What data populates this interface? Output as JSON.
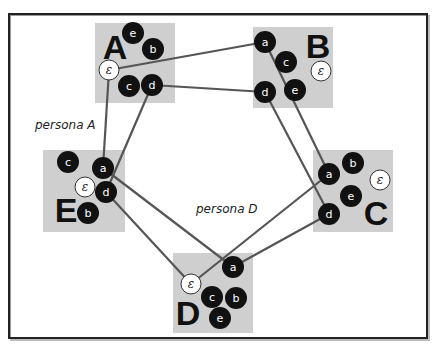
{
  "colors": {
    "background": "#ffffff",
    "frame": "#222222",
    "box_fill": "#cfcfcf",
    "node_fill": "#111111",
    "epsilon_fill": "#ffffff",
    "link": "#555555"
  },
  "labels": {
    "persona_a": "persona A",
    "persona_d": "persona D"
  },
  "groups": [
    {
      "id": "A",
      "label": "A",
      "box": [
        95,
        23,
        80,
        80
      ],
      "label_pos": [
        115,
        47
      ],
      "nodes": [
        {
          "id": "e",
          "label": "e",
          "pos": [
            133,
            33
          ],
          "type": "dark"
        },
        {
          "id": "b",
          "label": "b",
          "pos": [
            153,
            49
          ],
          "type": "dark"
        },
        {
          "id": "eps",
          "label": "ε",
          "pos": [
            109,
            70
          ],
          "type": "light"
        },
        {
          "id": "c",
          "label": "c",
          "pos": [
            129,
            86
          ],
          "type": "dark"
        },
        {
          "id": "d",
          "label": "d",
          "pos": [
            152,
            85
          ],
          "type": "dark"
        }
      ]
    },
    {
      "id": "B",
      "label": "B",
      "box": [
        253,
        27,
        80,
        81
      ],
      "label_pos": [
        318,
        46
      ],
      "nodes": [
        {
          "id": "a",
          "label": "a",
          "pos": [
            265,
            42
          ],
          "type": "dark"
        },
        {
          "id": "c",
          "label": "c",
          "pos": [
            286,
            62
          ],
          "type": "dark"
        },
        {
          "id": "eps",
          "label": "ε",
          "pos": [
            321,
            71
          ],
          "type": "light"
        },
        {
          "id": "d",
          "label": "d",
          "pos": [
            265,
            92
          ],
          "type": "dark"
        },
        {
          "id": "e",
          "label": "e",
          "pos": [
            295,
            90
          ],
          "type": "dark"
        }
      ]
    },
    {
      "id": "C",
      "label": "C",
      "box": [
        313,
        150,
        80,
        82
      ],
      "label_pos": [
        376,
        213
      ],
      "nodes": [
        {
          "id": "b",
          "label": "b",
          "pos": [
            353,
            163
          ],
          "type": "dark"
        },
        {
          "id": "a",
          "label": "a",
          "pos": [
            329,
            174
          ],
          "type": "dark"
        },
        {
          "id": "eps",
          "label": "ε",
          "pos": [
            380,
            180
          ],
          "type": "light"
        },
        {
          "id": "e",
          "label": "e",
          "pos": [
            351,
            196
          ],
          "type": "dark"
        },
        {
          "id": "d",
          "label": "d",
          "pos": [
            329,
            214
          ],
          "type": "dark"
        }
      ]
    },
    {
      "id": "D",
      "label": "D",
      "box": [
        173,
        253,
        80,
        80
      ],
      "label_pos": [
        188,
        313
      ],
      "nodes": [
        {
          "id": "a",
          "label": "a",
          "pos": [
            233,
            267
          ],
          "type": "dark"
        },
        {
          "id": "eps",
          "label": "ε",
          "pos": [
            191,
            284
          ],
          "type": "light"
        },
        {
          "id": "c",
          "label": "c",
          "pos": [
            212,
            297
          ],
          "type": "dark"
        },
        {
          "id": "b",
          "label": "b",
          "pos": [
            236,
            298
          ],
          "type": "dark"
        },
        {
          "id": "e",
          "label": "e",
          "pos": [
            220,
            318
          ],
          "type": "dark"
        }
      ]
    },
    {
      "id": "E",
      "label": "E",
      "box": [
        43,
        150,
        82,
        82
      ],
      "label_pos": [
        66,
        210
      ],
      "nodes": [
        {
          "id": "c",
          "label": "c",
          "pos": [
            68,
            162
          ],
          "type": "dark"
        },
        {
          "id": "a",
          "label": "a",
          "pos": [
            103,
            168
          ],
          "type": "dark"
        },
        {
          "id": "eps",
          "label": "ε",
          "pos": [
            85,
            187
          ],
          "type": "light"
        },
        {
          "id": "d",
          "label": "d",
          "pos": [
            106,
            192
          ],
          "type": "dark"
        },
        {
          "id": "b",
          "label": "b",
          "pos": [
            88,
            213
          ],
          "type": "dark"
        }
      ]
    }
  ],
  "links": [
    {
      "from": "A.eps",
      "to": "B.a"
    },
    {
      "from": "A.d",
      "to": "B.d"
    },
    {
      "from": "A.eps",
      "to": "E.a"
    },
    {
      "from": "A.d",
      "to": "E.d"
    },
    {
      "from": "B.a",
      "to": "C.a"
    },
    {
      "from": "B.d",
      "to": "C.d"
    },
    {
      "from": "E.a",
      "to": "D.a"
    },
    {
      "from": "E.d",
      "to": "D.eps"
    },
    {
      "from": "C.a",
      "to": "D.eps"
    },
    {
      "from": "C.d",
      "to": "D.a"
    }
  ]
}
